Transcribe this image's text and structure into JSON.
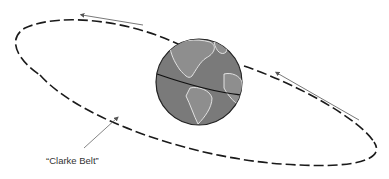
{
  "diagram": {
    "label": "“Clarke Belt”",
    "elements": {
      "orbit": "dashed elliptical orbit ring",
      "globe": "Earth showing the Americas with equator line",
      "direction_arrows": 2,
      "pointer_arrow": "points from label to orbit"
    },
    "colors": {
      "orbit_stroke": "#1a1a1a",
      "globe_fill": "#7a7a7a",
      "globe_outline": "#222222",
      "continent_lines": "#e8e8e8",
      "arrow_stroke": "#555555",
      "background": "#ffffff"
    }
  }
}
